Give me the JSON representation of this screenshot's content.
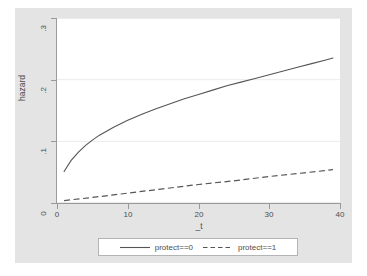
{
  "chart_data": {
    "type": "line",
    "title": "",
    "xlabel": "_t",
    "ylabel": "hazard",
    "xlim": [
      0,
      40
    ],
    "ylim": [
      0,
      0.3
    ],
    "grid": true,
    "grid_orientation": "horizontal",
    "legend_position": "bottom",
    "x_ticks": [
      "0",
      "10",
      "20",
      "30",
      "40"
    ],
    "x_tick_values": [
      0,
      10,
      20,
      30,
      40
    ],
    "y_ticks": [
      "0",
      ".1",
      ".2",
      ".3"
    ],
    "y_tick_values": [
      0,
      0.1,
      0.2,
      0.3
    ],
    "series": [
      {
        "name": "protect==0",
        "style": "solid",
        "color": "#555555",
        "x": [
          1,
          2,
          3,
          4,
          5,
          6,
          8,
          10,
          12,
          14,
          16,
          18,
          20,
          22,
          24,
          26,
          28,
          30,
          32,
          34,
          36,
          38,
          39
        ],
        "values": [
          0.051,
          0.069,
          0.082,
          0.093,
          0.102,
          0.11,
          0.123,
          0.134,
          0.144,
          0.153,
          0.161,
          0.169,
          0.176,
          0.183,
          0.19,
          0.196,
          0.202,
          0.208,
          0.214,
          0.22,
          0.226,
          0.232,
          0.235
        ]
      },
      {
        "name": "protect==1",
        "style": "dashed",
        "color": "#555555",
        "x": [
          1,
          5,
          10,
          15,
          20,
          25,
          30,
          35,
          39
        ],
        "values": [
          0.004,
          0.009,
          0.016,
          0.023,
          0.03,
          0.036,
          0.043,
          0.049,
          0.054
        ]
      }
    ],
    "legend": [
      {
        "label": "protect==0",
        "style": "solid"
      },
      {
        "label": "protect==1",
        "style": "dashed"
      }
    ]
  },
  "colors": {
    "graph_region_background": "#e4e4e4",
    "plot_background": "#ffffff",
    "axis": "#9a9a9a",
    "gridline": "#ebebeb",
    "line": "#555555",
    "text": "#4d4d4d",
    "legend_border": "#b4b4b4"
  }
}
